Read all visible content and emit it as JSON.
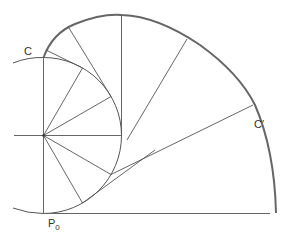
{
  "labels": {
    "circle": "C",
    "curve": "C′",
    "point_main": "P",
    "point_sub": "0"
  },
  "colors": {
    "thin_line": "#555555",
    "curve": "#666666",
    "background": "#ffffff"
  },
  "geometry": {
    "center": [
      43.5,
      135.5
    ],
    "radius": 78
  }
}
